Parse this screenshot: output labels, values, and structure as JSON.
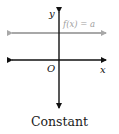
{
  "diagram": {
    "caption": "Constant",
    "axis_labels": {
      "y": "y",
      "x": "x",
      "origin": "O"
    },
    "function_label": "f(x) = a",
    "colors": {
      "axes": "#111111",
      "function_line": "#a8a8a8",
      "function_label": "#a0a0a0"
    }
  }
}
